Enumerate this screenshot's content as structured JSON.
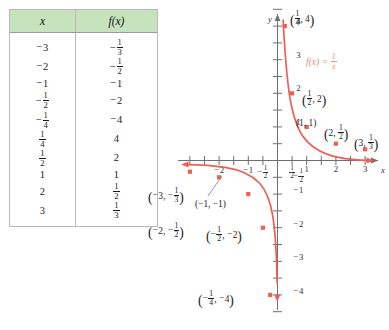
{
  "table": {
    "headers": [
      "x",
      "f(x)"
    ],
    "rows": [
      {
        "x": "-3",
        "fx": "-1/3"
      },
      {
        "x": "-2",
        "fx": "-1/2"
      },
      {
        "x": "-1",
        "fx": "-1"
      },
      {
        "x": "-1/2",
        "fx": "-2"
      },
      {
        "x": "-1/4",
        "fx": "-4"
      },
      {
        "x": "1/4",
        "fx": "4"
      },
      {
        "x": "1/2",
        "fx": "2"
      },
      {
        "x": "1",
        "fx": "1"
      },
      {
        "x": "2",
        "fx": "1/2"
      },
      {
        "x": "3",
        "fx": "1/3"
      }
    ],
    "header_bg": "#c6e3be"
  },
  "graph": {
    "function_label": "f(x) = 1/x",
    "x_axis_label": "x",
    "y_axis_label": "y",
    "curve_color": "#ef5f53",
    "axis_color": "#6f6f6f",
    "x_tick_labels": [
      "-2",
      "-1",
      "-1/2",
      "1/2",
      "1",
      "2",
      "3"
    ],
    "y_tick_labels": [
      "4",
      "3",
      "2",
      "1",
      "-1/2",
      "-1",
      "-2",
      "-3",
      "-4"
    ],
    "point_labels": [
      "(1/4, 4)",
      "(1/2, 2)",
      "(1, 1)",
      "(2, 1/2)",
      "(3, 1/3)",
      "(-3, -1/3)",
      "(-2, -1/2)",
      "(-1, -1)",
      "(-1/2, -2)",
      "(-1/4, -4)"
    ]
  },
  "chart_data": {
    "type": "line",
    "title": "",
    "xlabel": "x",
    "ylabel": "y",
    "equation": "f(x) = 1/x",
    "xlim": [
      -3.4,
      3.6
    ],
    "ylim": [
      -4.6,
      4.5
    ],
    "grid": false,
    "legend": "none",
    "x": [
      -3,
      -2,
      -1,
      -0.5,
      -0.25,
      0.25,
      0.5,
      1,
      2,
      3
    ],
    "y": [
      -0.3333,
      -0.5,
      -1,
      -2,
      -4,
      4,
      2,
      1,
      0.5,
      0.3333
    ],
    "series": [
      {
        "name": "f(x) = 1/x",
        "points": [
          {
            "x": -3,
            "y": -0.3333,
            "label": "(-3, -1/3)"
          },
          {
            "x": -2,
            "y": -0.5,
            "label": "(-2, -1/2)"
          },
          {
            "x": -1,
            "y": -1,
            "label": "(-1, -1)"
          },
          {
            "x": -0.5,
            "y": -2,
            "label": "(-1/2, -2)"
          },
          {
            "x": -0.25,
            "y": -4,
            "label": "(-1/4, -4)"
          },
          {
            "x": 0.25,
            "y": 4,
            "label": "(1/4, 4)"
          },
          {
            "x": 0.5,
            "y": 2,
            "label": "(1/2, 2)"
          },
          {
            "x": 1,
            "y": 1,
            "label": "(1, 1)"
          },
          {
            "x": 2,
            "y": 0.5,
            "label": "(2, 1/2)"
          },
          {
            "x": 3,
            "y": 0.3333,
            "label": "(3, 1/3)"
          }
        ]
      }
    ],
    "x_ticks": [
      -2,
      -1,
      -0.5,
      0.5,
      1,
      2,
      3
    ],
    "x_tick_labels": [
      "-2",
      "-1",
      "-1/2",
      "1/2",
      "1",
      "2",
      "3"
    ],
    "y_ticks": [
      4,
      3,
      2,
      1,
      -0.5,
      -1,
      -2,
      -3,
      -4
    ],
    "y_tick_labels": [
      "4",
      "3",
      "2",
      "1",
      "-1/2",
      "-1",
      "-2",
      "-3",
      "-4"
    ]
  }
}
